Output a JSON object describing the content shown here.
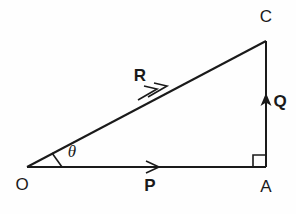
{
  "figure": {
    "background_color": "#fefefe",
    "line_color": "#1a1a1a"
  },
  "points": [
    {
      "key": "O",
      "label": "O",
      "x": 27,
      "y": 167,
      "label_x": 22,
      "label_y": 190
    },
    {
      "key": "A",
      "label": "A",
      "x": 266,
      "y": 167,
      "label_x": 261,
      "label_y": 192
    },
    {
      "key": "C",
      "label": "C",
      "x": 266,
      "y": 41,
      "label_x": 261,
      "label_y": 22
    }
  ],
  "vectors": [
    {
      "key": "P",
      "label": "P",
      "from": "O",
      "to": "A",
      "orientation": "horizontal",
      "arrowheads": 1,
      "label_x": 145,
      "label_y": 191
    },
    {
      "key": "Q",
      "label": "Q",
      "from": "A",
      "to": "C",
      "orientation": "vertical",
      "arrowheads": 1,
      "label_x": 272,
      "label_y": 107
    },
    {
      "key": "R",
      "label": "R",
      "from": "O",
      "to": "C",
      "orientation": "diagonal",
      "arrowheads": 2,
      "label_x": 133,
      "label_y": 82
    }
  ],
  "angle": {
    "symbol": "θ",
    "at_point": "O",
    "between": [
      "P",
      "R"
    ],
    "label_x": 66,
    "label_y": 157
  },
  "right_angle": {
    "at_point": "A",
    "marker": "square",
    "size": 11
  }
}
